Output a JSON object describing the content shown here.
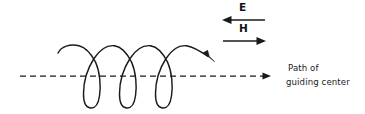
{
  "figure": {
    "kind": "physics-diagram",
    "title": "",
    "background_color": "#ffffff",
    "stroke_color": "#1a1a1a",
    "fields": [
      {
        "name": "electric-field",
        "label": "E",
        "direction": "left",
        "arrow_y": 20,
        "arrow_x_start": 265,
        "arrow_x_end": 223
      },
      {
        "name": "magnetic-field",
        "label": "H",
        "direction": "right",
        "arrow_y": 41,
        "arrow_x_start": 223,
        "arrow_x_end": 266
      }
    ],
    "guiding_center_axis": {
      "name": "guiding-center-axis",
      "style": "dashed",
      "direction": "right",
      "y": 76,
      "x_start": 20,
      "x_end": 271,
      "dash_pattern": "6,4"
    },
    "helix": {
      "name": "helical-particle-path",
      "loops": 3,
      "direction": "right",
      "has_arrowhead": true,
      "x_start": 58,
      "x_end": 216,
      "y_top": 45,
      "y_bottom": 108,
      "arrowhead_at": [
        216,
        46
      ]
    },
    "caption": {
      "line1": "Path of",
      "line2": "guiding center"
    }
  }
}
